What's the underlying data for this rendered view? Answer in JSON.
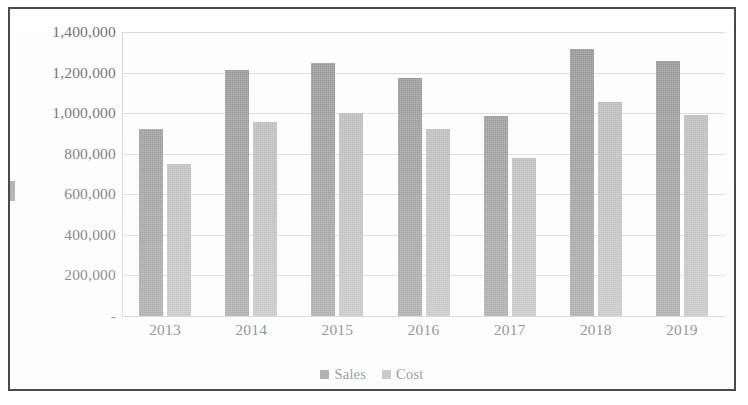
{
  "chart_data": {
    "type": "bar",
    "title": "",
    "subtitle": "",
    "xlabel": "",
    "ylabel": "",
    "categories": [
      "2013",
      "2014",
      "2015",
      "2016",
      "2017",
      "2018",
      "2019"
    ],
    "series": [
      {
        "name": "Sales",
        "color": "#8f8f8f",
        "values": [
          920000,
          1215000,
          1245000,
          1175000,
          985000,
          1315000,
          1255000
        ]
      },
      {
        "name": "Cost",
        "color": "#b4b4b4",
        "values": [
          750000,
          955000,
          1000000,
          920000,
          780000,
          1055000,
          990000
        ]
      }
    ],
    "ylim": [
      0,
      1400000
    ],
    "ytick_values": [
      1400000,
      1200000,
      1000000,
      800000,
      600000,
      400000,
      200000,
      0
    ],
    "ytick_labels": [
      "1,400,000",
      "1,200,000",
      "1,000,000",
      "800,000",
      "600,000",
      "400,000",
      "200,000",
      "-"
    ],
    "grid": true,
    "grid_axis": "y",
    "legend_position": "bottom",
    "legend_entries": [
      "Sales",
      "Cost"
    ]
  },
  "legend": {
    "items": [
      {
        "label": "Sales",
        "swatch": "sales-swatch"
      },
      {
        "label": "Cost",
        "swatch": "cost-swatch"
      }
    ]
  },
  "colors": {
    "sales": "#8f8f8f",
    "cost": "#b4b4b4",
    "gridline": "#dcdcdc",
    "frame_border": "#4a4a4a",
    "tick_text": "#6f6f6f",
    "background": "#fefefe"
  }
}
